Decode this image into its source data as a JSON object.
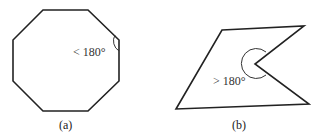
{
  "figure_a": {
    "caption": "(a)",
    "angle_label": "< 180°",
    "shape": "octagon",
    "stroke_color": "#222222"
  },
  "figure_b": {
    "caption": "(b)",
    "angle_label": "> 180°",
    "shape": "concave quadrilateral-like polygon",
    "stroke_color": "#222222"
  }
}
